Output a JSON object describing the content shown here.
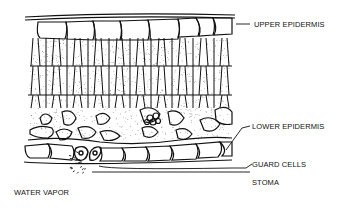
{
  "diagram": {
    "labels": {
      "upper_epidermis": "UPPER EPIDERMIS",
      "lower_epidermis": "LOWER EPIDERMIS",
      "guard_cells": "GUARD CELLS",
      "stoma": "STOMA",
      "water_vapor": "WATER VAPOR"
    },
    "colors": {
      "ink": "#111111",
      "background": "#ffffff"
    }
  }
}
